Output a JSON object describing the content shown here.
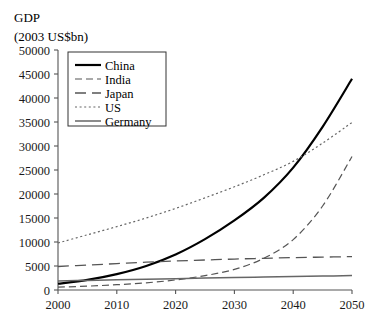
{
  "chart_data": {
    "type": "line",
    "title": "GDP",
    "subtitle": "(2003 US$bn)",
    "xlabel": "",
    "ylabel": "",
    "xlim": [
      2000,
      2050
    ],
    "ylim": [
      0,
      50000
    ],
    "grid": false,
    "legend_position": "top-left",
    "x_ticks": [
      2000,
      2010,
      2020,
      2030,
      2040,
      2050
    ],
    "x_tick_labels": [
      "2000",
      "2010",
      "2020",
      "2030",
      "2040",
      "2050"
    ],
    "y_ticks": [
      0,
      5000,
      10000,
      15000,
      20000,
      25000,
      30000,
      35000,
      40000,
      45000,
      50000
    ],
    "y_tick_labels": [
      "0",
      "5000",
      "10000",
      "15000",
      "20000",
      "25000",
      "30000",
      "35000",
      "40000",
      "45000",
      "50000"
    ],
    "x": [
      2000,
      2005,
      2010,
      2015,
      2020,
      2025,
      2030,
      2035,
      2040,
      2045,
      2050
    ],
    "series": [
      {
        "name": "China",
        "style": "solid",
        "color": "#000000",
        "width": 2.2,
        "dash": "none",
        "values": [
          1300,
          2100,
          3300,
          5000,
          7400,
          10600,
          14500,
          19200,
          25500,
          34000,
          44000
        ]
      },
      {
        "name": "India",
        "style": "dashed-short",
        "color": "#555555",
        "width": 1.2,
        "dash": "7,4",
        "values": [
          600,
          800,
          1100,
          1500,
          2100,
          3000,
          4300,
          6600,
          10500,
          17500,
          27800
        ]
      },
      {
        "name": "Japan",
        "style": "dashed-long",
        "color": "#555555",
        "width": 1.3,
        "dash": "11,6",
        "values": [
          4900,
          5200,
          5500,
          5800,
          6050,
          6250,
          6450,
          6600,
          6750,
          6850,
          6950
        ]
      },
      {
        "name": "US",
        "style": "dotted",
        "color": "#666666",
        "width": 1.2,
        "dash": "2,2.6",
        "values": [
          9800,
          11500,
          13200,
          15000,
          17000,
          19200,
          21500,
          24000,
          26800,
          30600,
          34900
        ]
      },
      {
        "name": "Germany",
        "style": "solid-thin",
        "color": "#666666",
        "width": 1.5,
        "dash": "none",
        "values": [
          1900,
          2000,
          2120,
          2240,
          2360,
          2480,
          2600,
          2700,
          2800,
          2900,
          3000
        ]
      }
    ]
  }
}
